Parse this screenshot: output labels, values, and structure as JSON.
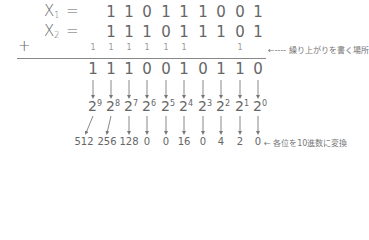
{
  "operands": [
    {
      "label": "X",
      "subscript": "1",
      "equals": "=",
      "digits": [
        "1",
        "1",
        "0",
        "1",
        "1",
        "1",
        "0",
        "0",
        "1"
      ]
    },
    {
      "label": "X",
      "subscript": "2",
      "equals": "=",
      "digits": [
        "1",
        "1",
        "1",
        "0",
        "1",
        "1",
        "1",
        "0",
        "1"
      ]
    }
  ],
  "plus_sign": "+",
  "carries": [
    "1",
    "1",
    "1",
    "1",
    "1",
    "1",
    "",
    "",
    "1",
    ""
  ],
  "carry_note": "←---- 繰り上がりを書く場所",
  "result_digits": [
    "1",
    "1",
    "1",
    "0",
    "0",
    "1",
    "0",
    "1",
    "1",
    "0"
  ],
  "powers": [
    {
      "base": "2",
      "exp": "9"
    },
    {
      "base": "2",
      "exp": "8"
    },
    {
      "base": "2",
      "exp": "7"
    },
    {
      "base": "2",
      "exp": "6"
    },
    {
      "base": "2",
      "exp": "5"
    },
    {
      "base": "2",
      "exp": "4"
    },
    {
      "base": "2",
      "exp": "3"
    },
    {
      "base": "2",
      "exp": "2"
    },
    {
      "base": "2",
      "exp": "1"
    },
    {
      "base": "2",
      "exp": "0"
    }
  ],
  "decimal_values": [
    "512",
    "256",
    "128",
    "0",
    "0",
    "16",
    "0",
    "4",
    "2",
    "0"
  ],
  "decimal_note": "← 各位を10進数に変換",
  "colors": {
    "text": "#666666",
    "line": "#888888",
    "arrow": "#777777"
  }
}
